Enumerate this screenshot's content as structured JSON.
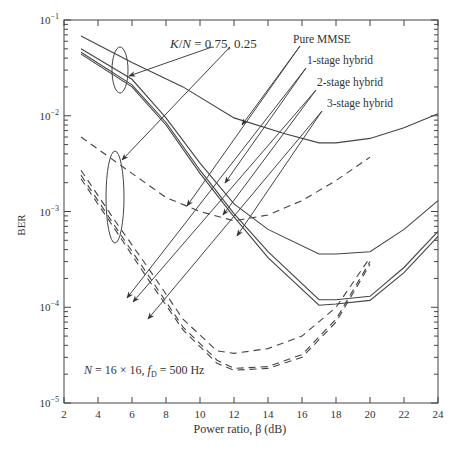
{
  "chart_data": {
    "type": "line",
    "title": "",
    "xlabel": "Power ratio, β (dB)",
    "ylabel": "BER",
    "xlim": [
      2,
      24
    ],
    "ylim": [
      1e-05,
      0.1
    ],
    "yscale": "log",
    "grid": false,
    "x_ticks": [
      2,
      4,
      6,
      8,
      10,
      12,
      14,
      16,
      18,
      20,
      22,
      24
    ],
    "y_ticks": [
      "10^-5",
      "10^-4",
      "10^-3",
      "10^-2",
      "10^-1"
    ],
    "annotations": [
      {
        "text": "K/N = 0.75, 0.25",
        "note": "arrows point to solid group (0.75) and dashed group (0.25)"
      },
      {
        "text": "Pure MMSE"
      },
      {
        "text": "1-stage hybrid"
      },
      {
        "text": "2-stage hybrid"
      },
      {
        "text": "3-stage hybrid"
      },
      {
        "text": "N = 16×16, f_D = 500 Hz"
      }
    ],
    "series": [
      {
        "name": "Pure MMSE, K/N=0.75",
        "style": "solid",
        "x": [
          3,
          6,
          9,
          12,
          15,
          17,
          18,
          20,
          22,
          24
        ],
        "y": [
          0.068,
          0.036,
          0.02,
          0.0095,
          0.0065,
          0.0052,
          0.0052,
          0.0058,
          0.0075,
          0.0105
        ]
      },
      {
        "name": "1-stage hybrid, K/N=0.75",
        "style": "solid",
        "x": [
          3,
          6,
          8,
          10,
          12,
          14,
          17,
          18,
          20,
          22,
          24
        ],
        "y": [
          0.05,
          0.024,
          0.0095,
          0.0032,
          0.0012,
          0.00065,
          0.00036,
          0.00036,
          0.00038,
          0.00065,
          0.0013
        ]
      },
      {
        "name": "2-stage hybrid, K/N=0.75",
        "style": "solid",
        "x": [
          3,
          6,
          8,
          10,
          12,
          14,
          17,
          18,
          20,
          22,
          24
        ],
        "y": [
          0.046,
          0.021,
          0.0085,
          0.0027,
          0.00095,
          0.00038,
          0.00012,
          0.00012,
          0.00013,
          0.00026,
          0.00062
        ]
      },
      {
        "name": "3-stage hybrid, K/N=0.75",
        "style": "solid",
        "x": [
          3,
          6,
          8,
          10,
          12,
          14,
          17,
          18,
          20,
          22,
          24
        ],
        "y": [
          0.044,
          0.02,
          0.008,
          0.0025,
          0.00088,
          0.00033,
          0.000105,
          0.000108,
          0.000118,
          0.00023,
          0.00055
        ]
      },
      {
        "name": "Pure MMSE, K/N=0.25",
        "style": "dashed",
        "x": [
          3,
          6,
          8,
          10,
          12,
          14,
          16,
          18,
          20
        ],
        "y": [
          0.006,
          0.0025,
          0.0014,
          0.001,
          0.0008,
          0.00092,
          0.0013,
          0.0021,
          0.0037
        ]
      },
      {
        "name": "1-stage hybrid, K/N=0.25",
        "style": "dashed",
        "x": [
          3,
          5,
          7,
          9,
          11,
          12,
          14,
          16,
          18,
          20
        ],
        "y": [
          0.0027,
          0.0008,
          0.00025,
          7.5e-05,
          3.5e-05,
          3.3e-05,
          3.7e-05,
          5e-05,
          0.0001,
          0.00033
        ]
      },
      {
        "name": "2-stage hybrid, K/N=0.25",
        "style": "dashed",
        "x": [
          3,
          5,
          7,
          9,
          11,
          12,
          14,
          16,
          18,
          20
        ],
        "y": [
          0.0024,
          0.0007,
          0.00021,
          6.2e-05,
          2.8e-05,
          2.3e-05,
          2.4e-05,
          3.2e-05,
          7.5e-05,
          0.0003
        ]
      },
      {
        "name": "3-stage hybrid, K/N=0.25",
        "style": "dashed",
        "x": [
          3,
          5,
          7,
          9,
          11,
          12,
          14,
          16,
          18,
          20
        ],
        "y": [
          0.0022,
          0.00065,
          0.00019,
          5.8e-05,
          2.6e-05,
          2.2e-05,
          2.3e-05,
          3e-05,
          7e-05,
          0.00028
        ]
      }
    ]
  },
  "labels": {
    "ylabel": "BER",
    "xlabel": "Power ratio, β (dB)",
    "kn": "K/N = 0.75, 0.25",
    "pure": "Pure MMSE",
    "s1": "1-stage hybrid",
    "s2": "2-stage hybrid",
    "s3": "3-stage hybrid",
    "params": "N = 16 × 16, f",
    "params_sub": "D",
    "params_tail": " = 500 Hz"
  }
}
